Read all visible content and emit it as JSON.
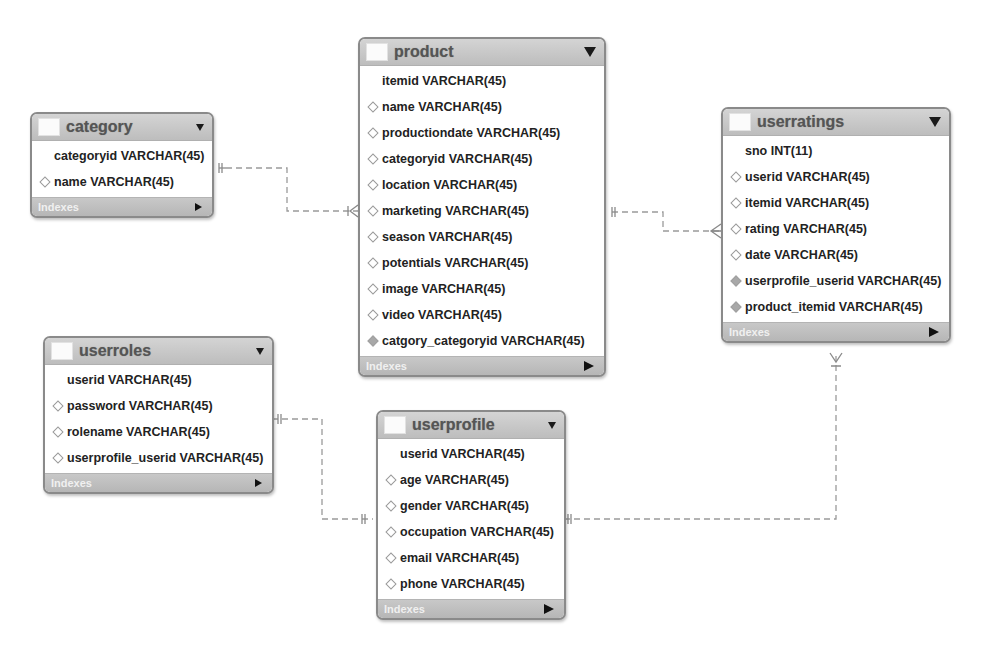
{
  "diagram": {
    "type": "EER diagram",
    "footer_label": "Indexes",
    "tables": {
      "category": {
        "name": "category",
        "columns": [
          {
            "label": "categoryid VARCHAR(45)",
            "marker": "primary-key"
          },
          {
            "label": "name VARCHAR(45)",
            "marker": "column"
          }
        ]
      },
      "product": {
        "name": "product",
        "columns": [
          {
            "label": "itemid VARCHAR(45)",
            "marker": "primary-key"
          },
          {
            "label": "name VARCHAR(45)",
            "marker": "column"
          },
          {
            "label": "productiondate VARCHAR(45)",
            "marker": "column"
          },
          {
            "label": "categoryid VARCHAR(45)",
            "marker": "column"
          },
          {
            "label": "location VARCHAR(45)",
            "marker": "column"
          },
          {
            "label": "marketing VARCHAR(45)",
            "marker": "column"
          },
          {
            "label": "season VARCHAR(45)",
            "marker": "column"
          },
          {
            "label": "potentials VARCHAR(45)",
            "marker": "column"
          },
          {
            "label": "image VARCHAR(45)",
            "marker": "column"
          },
          {
            "label": "video VARCHAR(45)",
            "marker": "column"
          },
          {
            "label": "catgory_categoryid VARCHAR(45)",
            "marker": "foreign-key"
          }
        ]
      },
      "userratings": {
        "name": "userratings",
        "columns": [
          {
            "label": "sno INT(11)",
            "marker": "primary-key"
          },
          {
            "label": "userid VARCHAR(45)",
            "marker": "column"
          },
          {
            "label": "itemid VARCHAR(45)",
            "marker": "column"
          },
          {
            "label": "rating VARCHAR(45)",
            "marker": "column"
          },
          {
            "label": "date VARCHAR(45)",
            "marker": "column"
          },
          {
            "label": "userprofile_userid VARCHAR(45)",
            "marker": "foreign-key"
          },
          {
            "label": "product_itemid VARCHAR(45)",
            "marker": "foreign-key"
          }
        ]
      },
      "userroles": {
        "name": "userroles",
        "columns": [
          {
            "label": "userid VARCHAR(45)",
            "marker": "primary-key"
          },
          {
            "label": "password VARCHAR(45)",
            "marker": "column"
          },
          {
            "label": "rolename VARCHAR(45)",
            "marker": "column"
          },
          {
            "label": "userprofile_userid VARCHAR(45)",
            "marker": "column"
          }
        ]
      },
      "userprofile": {
        "name": "userprofile",
        "columns": [
          {
            "label": "userid VARCHAR(45)",
            "marker": "primary-key"
          },
          {
            "label": "age VARCHAR(45)",
            "marker": "column"
          },
          {
            "label": "gender VARCHAR(45)",
            "marker": "column"
          },
          {
            "label": "occupation VARCHAR(45)",
            "marker": "column"
          },
          {
            "label": "email VARCHAR(45)",
            "marker": "column"
          },
          {
            "label": "phone VARCHAR(45)",
            "marker": "column"
          }
        ]
      }
    },
    "relationships": [
      {
        "from": "category",
        "to": "product",
        "from_end": "one-and-only-one",
        "to_end": "one-or-many"
      },
      {
        "from": "product",
        "to": "userratings",
        "from_end": "one-and-only-one",
        "to_end": "zero-or-many"
      },
      {
        "from": "userroles",
        "to": "userprofile",
        "from_end": "one-and-only-one",
        "to_end": "one-and-only-one"
      },
      {
        "from": "userprofile",
        "to": "userratings",
        "from_end": "one-and-only-one",
        "to_end": "one-or-many"
      }
    ],
    "colors": {
      "header_bg": "#c8c8c8",
      "footer_bg": "#bdbdbd",
      "border": "#8a8a8a",
      "connector": "#9a9a9a",
      "text": "#222222"
    }
  }
}
